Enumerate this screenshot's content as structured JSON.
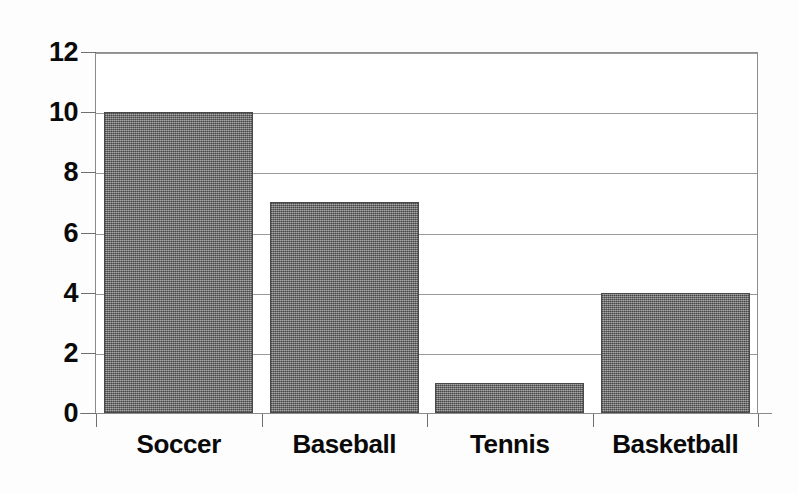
{
  "chart_data": {
    "type": "bar",
    "title": "",
    "subtitle": "",
    "xlabel": "",
    "ylabel": "",
    "categories": [
      "Soccer",
      "Baseball",
      "Tennis",
      "Basketball"
    ],
    "values": [
      10,
      7,
      1,
      4
    ],
    "ylim": [
      0,
      12
    ],
    "ytick_values": [
      12,
      10,
      8,
      6,
      4,
      2,
      0
    ],
    "ytick_labels": [
      "12",
      "10",
      "8",
      "6",
      "4",
      "2",
      "0"
    ],
    "ytick_step": 2,
    "grid": "horizontal",
    "legend": "none",
    "annotations": [],
    "colors": {
      "bar_fill": "#7c7c7c",
      "bar_outline": "#4a4a4a",
      "gridline": "#9a9a9a",
      "axis_line": "#8b8b8b",
      "text": "#0a0a0a",
      "background": "#ffffff"
    }
  }
}
